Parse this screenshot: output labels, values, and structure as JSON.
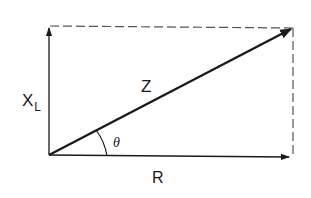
{
  "diagram": {
    "type": "impedance-phasor-triangle",
    "labels": {
      "reactance_main": "X",
      "reactance_sub": "L",
      "impedance": "Z",
      "resistance": "R",
      "angle": "θ"
    },
    "colors": {
      "stroke": "#1a1a1a",
      "dashed": "#555555",
      "background": "#ffffff"
    }
  }
}
